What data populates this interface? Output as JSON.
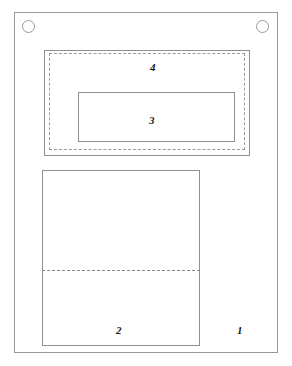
{
  "figure": {
    "width": 292,
    "height": 366,
    "background_color": "#ffffff",
    "line_color": "#8f8f8f",
    "label_color": "#1a1a1a",
    "type": "technical-line-drawing"
  },
  "labels": {
    "region_1": "1",
    "region_2": "2",
    "region_3": "3",
    "region_4": "4"
  },
  "elements": {
    "outer_frame": {
      "name": "outer panel outline",
      "label": "1",
      "stroke": "solid"
    },
    "hole_left": {
      "name": "upper-left mounting hole",
      "shape": "circle"
    },
    "hole_right": {
      "name": "upper-right mounting hole",
      "shape": "circle"
    },
    "rect_4": {
      "name": "upper enclosure outline",
      "label": "4",
      "stroke": "solid"
    },
    "dashed_4": {
      "name": "upper enclosure hidden outline",
      "stroke": "dashed"
    },
    "rect_3": {
      "name": "inner component outline",
      "label": "3",
      "stroke": "solid"
    },
    "rect_2": {
      "name": "lower panel outline",
      "label": "2",
      "stroke": "solid"
    },
    "dashed_split": {
      "name": "lower panel hidden division line",
      "stroke": "dashed"
    }
  }
}
